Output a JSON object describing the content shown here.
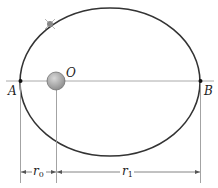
{
  "diagram": {
    "type": "elliptical-orbit",
    "labels": {
      "left_apsis": "A",
      "right_apsis": "B",
      "focus": "O",
      "r0_main": "r",
      "r0_sub": "0",
      "r1_main": "r",
      "r1_sub": "1"
    },
    "colors": {
      "orbit": "#333333",
      "axis": "#999999",
      "planet": "#a0a0a0",
      "satellite": "#888888"
    }
  }
}
